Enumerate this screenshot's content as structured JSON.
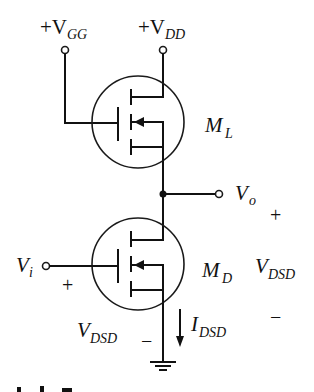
{
  "diagram": {
    "type": "circuit-schematic",
    "terminals": {
      "vgg": {
        "prefix": "+V",
        "sub": "GG"
      },
      "vdd": {
        "prefix": "+V",
        "sub": "DD"
      },
      "vo": {
        "main": "V",
        "sub": "o"
      },
      "vi": {
        "main": "V",
        "sub": "i"
      }
    },
    "transistors": {
      "load": {
        "main": "M",
        "sub": "L"
      },
      "driver": {
        "main": "M",
        "sub": "D"
      }
    },
    "labels": {
      "vdsd_right": {
        "main": "V",
        "sub": "DSD",
        "plus": "+",
        "minus": "−"
      },
      "vdsd_left": {
        "main": "V",
        "sub": "DSD",
        "plus": "+",
        "minus": "−"
      },
      "idsd": {
        "main": "I",
        "sub": "DSD"
      }
    },
    "icons": [
      "ground-icon",
      "current-arrow-icon",
      "terminal-circle-icon",
      "junction-dot-icon"
    ]
  }
}
